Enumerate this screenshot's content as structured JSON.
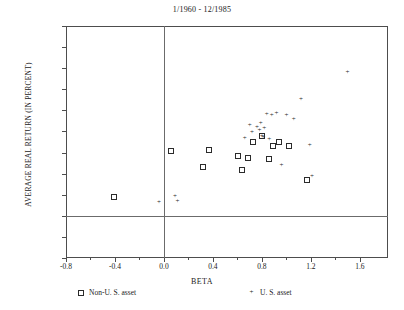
{
  "chart_data": {
    "type": "scatter",
    "title": "1/1960 - 12/1985",
    "xlabel": "BETA",
    "ylabel": "AVERAGE REAL RETURN (IN PERCENT)",
    "xlim": [
      -0.8,
      1.83
    ],
    "ylim": [
      -0.4,
      1.8
    ],
    "grid": false,
    "legend_position": "below-axes",
    "xticks": [
      -0.8,
      -0.4,
      0.0,
      0.4,
      0.8,
      1.2,
      1.6
    ],
    "xticklabels": [
      "-0.8",
      "-0.4",
      "0.0",
      "0.4",
      "0.8",
      "1.2",
      "1.6"
    ],
    "xminorticks": [
      -0.6,
      -0.2,
      0.2,
      0.6,
      1.0,
      1.4
    ],
    "yticks": [
      1.8,
      1.6,
      1.4,
      1.2,
      1.0,
      0.8,
      0.6,
      0.4,
      0.2,
      0.0,
      -0.2,
      -0.4
    ],
    "yticklabels": [
      "1.8",
      "1.6",
      "1.4",
      "1.2",
      "1.0",
      "0.8",
      "0.6",
      "0.4",
      "0.2",
      "0.0",
      "-0.2",
      "-0.4"
    ],
    "reference_lines": {
      "horizontal": 0.0,
      "vertical": 0.0
    },
    "series": [
      {
        "name": "Non-U. S. asset",
        "marker": "square",
        "points": [
          [
            -0.42,
            0.19
          ],
          [
            0.05,
            0.62
          ],
          [
            0.36,
            0.63
          ],
          [
            0.6,
            0.58
          ],
          [
            0.63,
            0.44
          ],
          [
            0.68,
            0.56
          ],
          [
            0.72,
            0.71
          ],
          [
            0.79,
            0.77
          ],
          [
            0.85,
            0.55
          ],
          [
            0.88,
            0.67
          ],
          [
            0.93,
            0.71
          ],
          [
            1.01,
            0.67
          ],
          [
            1.16,
            0.35
          ],
          [
            0.31,
            0.47
          ]
        ]
      },
      {
        "name": "U. S. asset",
        "marker": "plus",
        "points": [
          [
            -0.04,
            0.13
          ],
          [
            0.09,
            0.18
          ],
          [
            0.11,
            0.14
          ],
          [
            0.66,
            0.73
          ],
          [
            0.7,
            0.86
          ],
          [
            0.72,
            0.79
          ],
          [
            0.76,
            0.84
          ],
          [
            0.78,
            0.81
          ],
          [
            0.79,
            0.88
          ],
          [
            0.8,
            0.75
          ],
          [
            0.81,
            0.74
          ],
          [
            0.82,
            0.83
          ],
          [
            0.84,
            0.96
          ],
          [
            0.86,
            0.72
          ],
          [
            0.88,
            0.95
          ],
          [
            0.92,
            0.97
          ],
          [
            1.0,
            0.95
          ],
          [
            1.06,
            0.91
          ],
          [
            1.12,
            1.1
          ],
          [
            0.96,
            0.48
          ],
          [
            1.21,
            0.37
          ],
          [
            1.19,
            0.67
          ],
          [
            1.5,
            1.36
          ]
        ]
      }
    ]
  },
  "legend": {
    "non_us_label": "Non-U. S. asset",
    "us_label": "U. S. asset"
  }
}
